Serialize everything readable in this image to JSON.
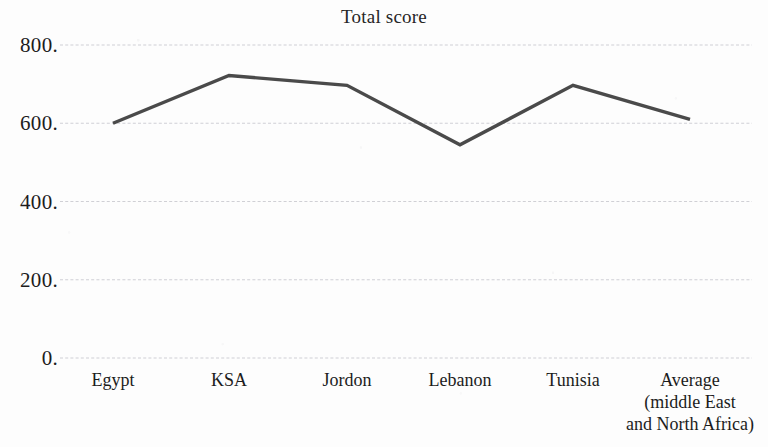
{
  "chart_data": {
    "type": "line",
    "title": "Total score",
    "xlabel": "",
    "ylabel": "",
    "categories": [
      "Egypt",
      "KSA",
      "Jordon",
      "Lebanon",
      "Tunisia",
      "Average\n(middle East\nand North Africa)"
    ],
    "category_labels_flat": [
      "Egypt",
      "KSA",
      "Jordon",
      "Lebanon",
      "Tunisia",
      "Average (middle East and North Africa)"
    ],
    "values": [
      600,
      722,
      697,
      545,
      697,
      610
    ],
    "series": [
      {
        "name": "Total score",
        "values": [
          600,
          722,
          697,
          545,
          697,
          610
        ]
      }
    ],
    "ylim": [
      0,
      800
    ],
    "y_ticks": [
      0,
      200,
      400,
      600,
      800
    ],
    "y_tick_labels": [
      "0.",
      "200.",
      "400.",
      "600.",
      "800."
    ],
    "grid": true,
    "grid_axis": "y",
    "legend": "none",
    "line_color": "#4a4a4a",
    "grid_color": "#c9c9cf",
    "background_color": "#fdfdfd",
    "text_color": "#1c1c1c"
  }
}
